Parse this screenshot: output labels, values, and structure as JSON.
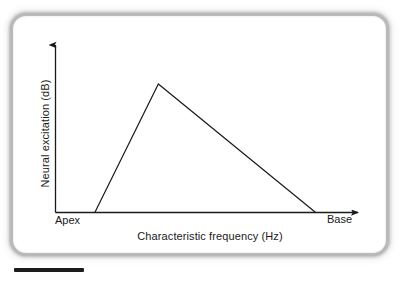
{
  "figure": {
    "frame_color": "#b9b9b9",
    "background": "#ffffff",
    "ink_color": "#1a1a1a"
  },
  "axes": {
    "y_axis_label": "Neural excitation (dB)",
    "x_axis_label": "Characteristic frequency (Hz)",
    "x_tick_left_label": "Apex",
    "x_tick_right_label": "Base"
  },
  "scale_bar": {
    "present": true,
    "color": "#1c1c1c"
  },
  "chart_data": {
    "type": "line",
    "title": "",
    "subtitle": "",
    "xlabel": "Characteristic frequency (Hz)",
    "ylabel": "Neural excitation (dB)",
    "xlim": [
      0,
      100
    ],
    "ylim": [
      0,
      100
    ],
    "grid": false,
    "legend": false,
    "axis_style": "arrow-tipped open axes (left and bottom spines only)",
    "x_tick_labels": [
      "Apex",
      "Base"
    ],
    "x_tick_positions": [
      0,
      100
    ],
    "y_tick_labels": [],
    "annotations": [],
    "series": [
      {
        "name": "Neural excitation pattern",
        "x": [
          13,
          34,
          86
        ],
        "y": [
          0,
          100,
          0
        ],
        "description": "Asymmetric triangular excitation pattern: steep rise from apex side to a peak, then a shallower linear decay toward the base side, reaching zero before the end of the axis.",
        "line_color": "#1a1a1a",
        "line_width": 1.2
      }
    ]
  }
}
